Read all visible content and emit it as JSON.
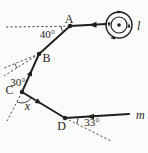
{
  "figure": {
    "points": {
      "A": "A",
      "B": "B",
      "C": "C",
      "D": "D"
    },
    "angles": {
      "at_A": "40°",
      "at_B": "30°",
      "at_C": "x",
      "at_D": "33°"
    },
    "lines": {
      "top": "l",
      "bottom": "m"
    },
    "colors": {
      "ink": "#1f1f1f",
      "background": "#fbfbf9"
    }
  }
}
